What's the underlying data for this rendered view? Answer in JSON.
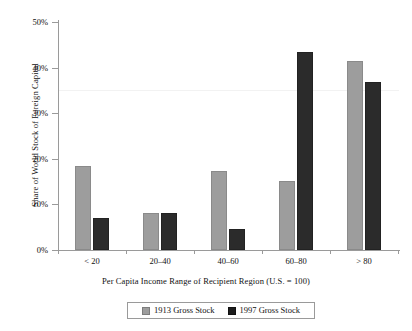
{
  "chart_data": {
    "type": "bar",
    "title": "",
    "xlabel": "Per Capita Income Range of Recipient Region (U.S. = 100)",
    "ylabel": "Share of World Stock of Foreign Capital",
    "categories": [
      "< 20",
      "20–40",
      "40–60",
      "60–80",
      "> 80"
    ],
    "series": [
      {
        "name": "1913 Gross Stock",
        "color": "#9d9d9d",
        "values": [
          18.4,
          8.2,
          17.4,
          15.2,
          41.4
        ]
      },
      {
        "name": "1997 Gross Stock",
        "color": "#1c1c1c",
        "values": [
          7.0,
          8.1,
          4.7,
          43.5,
          36.8
        ]
      }
    ],
    "ylim": [
      0,
      50
    ],
    "ytick_labels": [
      "50%",
      "40%",
      "30%",
      "20%",
      "10%",
      "0%"
    ],
    "ytick_values": [
      50,
      40,
      30,
      20,
      10,
      0
    ],
    "yaxis_tick_suffix": "%",
    "grid": false,
    "legend_position": "bottom"
  },
  "legend": {
    "entries": [
      {
        "label": "1913 Gross Stock",
        "swatch": "gray-swatch-icon"
      },
      {
        "label": "1997 Gross Stock",
        "swatch": "black-swatch-icon"
      }
    ]
  },
  "axis_titles": {
    "x": "Per Capita Income Range of Recipient Region (U.S. = 100)",
    "y": "Share of World Stock of Foreign Capital"
  },
  "colors": {
    "series_1913": "#9d9d9d",
    "series_1997": "#1c1c1c",
    "axis": "#9a9a9a",
    "text": "#111111",
    "background": "#ffffff"
  }
}
